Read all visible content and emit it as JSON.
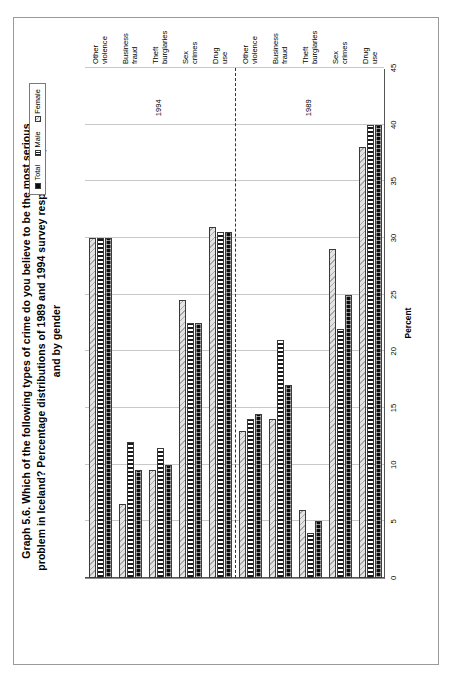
{
  "figure": {
    "title_lines": [
      "Graph 5.6.  Which of the following types of crime do you believe to be the most serious",
      "problem in Iceland? Percentage distributions of 1989 and 1994 survey respondents, in total",
      "and by gender"
    ],
    "title_full": "Graph 5.6.  Which of the following types of crime do you believe to be the most serious problem in Iceland? Percentage distributions of 1989 and 1994 survey respondents, in total and by gender"
  },
  "legend": {
    "position": "top-right",
    "items": [
      {
        "label": "Total",
        "pattern": "solid-black",
        "color": "#0d0d0d"
      },
      {
        "label": "Male",
        "pattern": "vertical-stripes",
        "color": "#1b1b1b"
      },
      {
        "label": "Female",
        "pattern": "diagonal-hatch",
        "color": "#e3e3e3"
      }
    ]
  },
  "axes": {
    "value_axis_title": "Percent",
    "value_ticks": [
      "45",
      "40",
      "35",
      "30",
      "25",
      "20",
      "15",
      "10",
      "5",
      "0"
    ],
    "value_min": 0,
    "value_max": 45,
    "grid": true
  },
  "periods": [
    {
      "label": "1989"
    },
    {
      "label": "1994"
    }
  ],
  "chart_data": {
    "type": "bar",
    "orientation": "horizontal",
    "xlabel": "Percent",
    "ylabel": "",
    "xlim": [
      0,
      45
    ],
    "grid": true,
    "legend_position": "top-right",
    "categories": [
      "Drug use",
      "Sex crimes",
      "Theft\nburglaries",
      "Business\nfraud",
      "Other\nviolence",
      "Drug use",
      "Sex crimes",
      "Theft\nburglaries",
      "Business\nfraud",
      "Other\nviolence"
    ],
    "category_periods": [
      "1989",
      "1989",
      "1989",
      "1989",
      "1989",
      "1994",
      "1994",
      "1994",
      "1994",
      "1994"
    ],
    "series": [
      {
        "name": "Total",
        "values": [
          40.0,
          25.0,
          5.0,
          17.0,
          14.5,
          30.5,
          22.5,
          10.0,
          9.5,
          30.0
        ]
      },
      {
        "name": "Male",
        "values": [
          40.0,
          22.0,
          4.0,
          21.0,
          14.0,
          30.5,
          22.5,
          11.5,
          12.0,
          30.0
        ]
      },
      {
        "name": "Female",
        "values": [
          38.0,
          29.0,
          6.0,
          14.0,
          13.0,
          31.0,
          24.5,
          9.5,
          6.5,
          30.0
        ]
      }
    ]
  }
}
